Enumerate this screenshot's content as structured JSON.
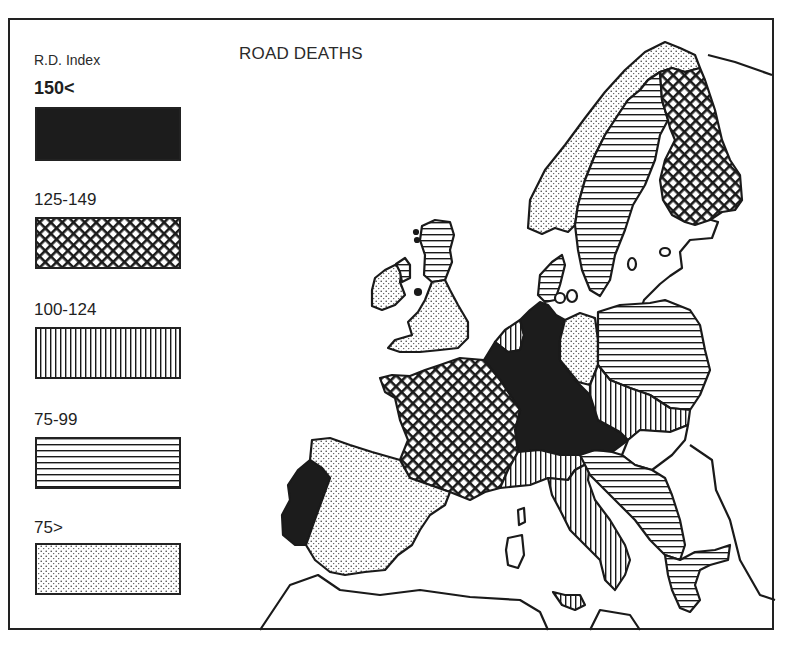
{
  "map": {
    "title": "ROAD DEATHS",
    "legend": {
      "title": "R.D. Index",
      "classes": [
        {
          "label": "150<",
          "pattern": "solid-black",
          "range": "150 and above"
        },
        {
          "label": "125-149",
          "pattern": "crosshatch",
          "range": "125 to 149"
        },
        {
          "label": "100-124",
          "pattern": "vertical-lines",
          "range": "100 to 124"
        },
        {
          "label": "75-99",
          "pattern": "horizontal-lines",
          "range": "75 to 99"
        },
        {
          "label": "75>",
          "pattern": "dotted",
          "range": "below 75"
        }
      ]
    },
    "regions": [
      {
        "name": "Norway",
        "class": "75>"
      },
      {
        "name": "Sweden",
        "class": "75-99"
      },
      {
        "name": "Finland",
        "class": "125-149"
      },
      {
        "name": "Denmark",
        "class": "75-99"
      },
      {
        "name": "Ireland",
        "class": "75>"
      },
      {
        "name": "Northern Ireland",
        "class": "75-99"
      },
      {
        "name": "Scotland",
        "class": "75-99"
      },
      {
        "name": "England and Wales",
        "class": "75>"
      },
      {
        "name": "Netherlands",
        "class": "100-124"
      },
      {
        "name": "Belgium",
        "class": "150<"
      },
      {
        "name": "West Germany",
        "class": "150<"
      },
      {
        "name": "East Germany",
        "class": "75>"
      },
      {
        "name": "Poland",
        "class": "75-99"
      },
      {
        "name": "Czechoslovakia",
        "class": "100-124"
      },
      {
        "name": "Austria",
        "class": "150<"
      },
      {
        "name": "Hungary",
        "class": "no data"
      },
      {
        "name": "France",
        "class": "125-149"
      },
      {
        "name": "Switzerland",
        "class": "100-124"
      },
      {
        "name": "Italy",
        "class": "100-124"
      },
      {
        "name": "Sicily",
        "class": "100-124"
      },
      {
        "name": "Yugoslavia",
        "class": "75-99"
      },
      {
        "name": "Greece",
        "class": "75-99"
      },
      {
        "name": "Spain",
        "class": "75>"
      },
      {
        "name": "Portugal",
        "class": "150<"
      }
    ]
  }
}
